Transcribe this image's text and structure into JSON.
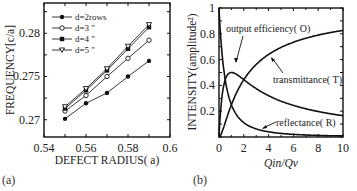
{
  "chart_data": [
    {
      "type": "line",
      "panel_label": "(a)",
      "title": "",
      "xlabel": "DEFECT RADIUS( a)",
      "ylabel": "FREQUENCY[c/a]",
      "xlim": [
        0.54,
        0.6
      ],
      "ylim": [
        0.268,
        0.2835
      ],
      "xticks": [
        "0.54",
        "0.56",
        "0.58",
        "0.6"
      ],
      "yticks": [
        "0.27",
        "0.275",
        "0.28"
      ],
      "grid": false,
      "legend_position": "upper-left",
      "x": [
        0.55,
        0.56,
        0.57,
        0.58,
        0.59
      ],
      "series": [
        {
          "name": "d=2rows",
          "marker": "filled-circle",
          "values": [
            0.2701,
            0.2719,
            0.2731,
            0.275,
            0.2768
          ]
        },
        {
          "name": "d=3 \"",
          "marker": "open-circle",
          "values": [
            0.271,
            0.2728,
            0.275,
            0.2771,
            0.2792
          ]
        },
        {
          "name": "d=4 \"",
          "marker": "filled-square",
          "values": [
            0.2713,
            0.2734,
            0.2757,
            0.2782,
            0.2807
          ]
        },
        {
          "name": "d=5 \"",
          "marker": "open-triangle-down",
          "values": [
            0.2715,
            0.2736,
            0.2759,
            0.2785,
            0.281
          ]
        }
      ]
    },
    {
      "type": "line",
      "panel_label": "(b)",
      "title": "",
      "xlabel": "Qin/Qv",
      "ylabel": "INTENSITY(amplitude²)",
      "xlim": [
        0,
        10
      ],
      "ylim": [
        0,
        1
      ],
      "xticks": [
        "0",
        "2",
        "4",
        "6",
        "8",
        "10"
      ],
      "yticks": [
        "0.2",
        "0.4",
        "0.6",
        "0.8",
        "1"
      ],
      "grid": false,
      "x": [
        0,
        0.25,
        0.5,
        1,
        1.5,
        2,
        3,
        4,
        5,
        6,
        7,
        8,
        9,
        10
      ],
      "series": [
        {
          "name": "transmittance( T)",
          "values": [
            0,
            0.04,
            0.11,
            0.25,
            0.36,
            0.44,
            0.56,
            0.64,
            0.69,
            0.73,
            0.77,
            0.79,
            0.81,
            0.83
          ]
        },
        {
          "name": "reflectance( R)",
          "values": [
            1,
            0.64,
            0.44,
            0.25,
            0.16,
            0.11,
            0.06,
            0.04,
            0.03,
            0.02,
            0.016,
            0.012,
            0.01,
            0.008
          ]
        },
        {
          "name": "output efficiency( O)",
          "values": [
            0,
            0.32,
            0.44,
            0.5,
            0.48,
            0.44,
            0.38,
            0.32,
            0.28,
            0.24,
            0.22,
            0.2,
            0.18,
            0.165
          ]
        }
      ],
      "annotations": [
        "output efficiency( O)",
        "transmittance( T)",
        "reflectance( R)"
      ]
    }
  ]
}
